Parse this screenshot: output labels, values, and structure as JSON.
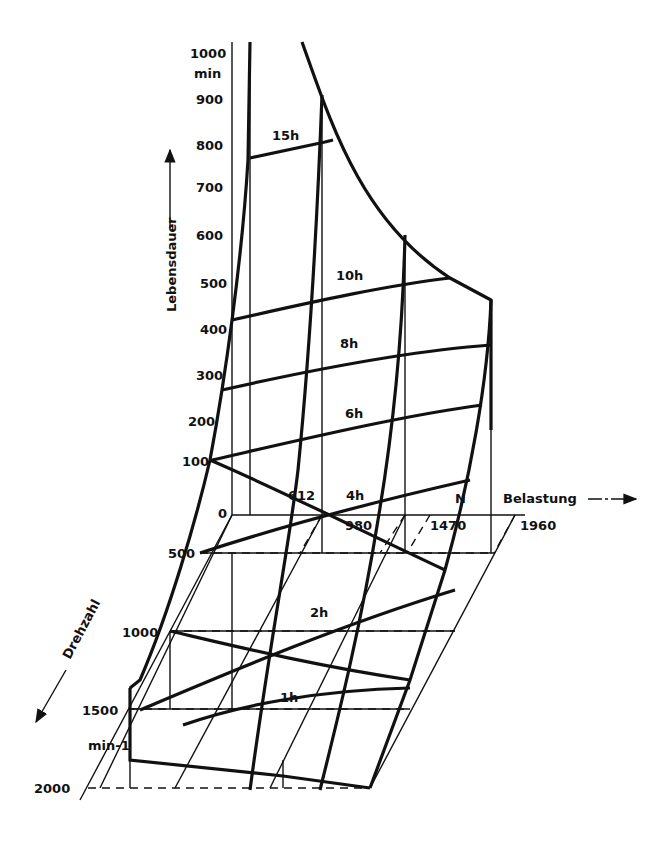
{
  "figure": {
    "colors": {
      "ink": "#111111",
      "background": "#ffffff"
    },
    "axes": {
      "lifetime": {
        "title": "Lebensdauer",
        "unit": "min",
        "ticks": [
          "1000",
          "900",
          "800",
          "700",
          "600",
          "500",
          "400",
          "300",
          "200",
          "100",
          "0"
        ]
      },
      "load": {
        "title": "Belastung",
        "unit": "N",
        "ticks": [
          "612",
          "980",
          "1470",
          "1960"
        ]
      },
      "speed": {
        "title": "Drehzahl",
        "unit": "min-1",
        "ticks": [
          "500",
          "1000",
          "1500",
          "2000"
        ]
      }
    },
    "curve_labels": [
      "15h",
      "10h",
      "8h",
      "6h",
      "4h",
      "2h",
      "1h"
    ]
  }
}
